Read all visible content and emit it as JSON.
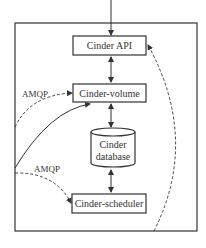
{
  "diagram": {
    "nodes": {
      "api": {
        "label": "Cinder API"
      },
      "volume": {
        "label": "Cinder-volume"
      },
      "database": {
        "line1": "Cinder",
        "line2": "database"
      },
      "scheduler": {
        "label": "Cinder-scheduler"
      }
    },
    "edges": {
      "amqp_volume": {
        "label": "AMQP"
      },
      "amqp_scheduler": {
        "label": "AMQP"
      }
    },
    "colors": {
      "stroke": "#333333",
      "background": "#ffffff"
    }
  }
}
